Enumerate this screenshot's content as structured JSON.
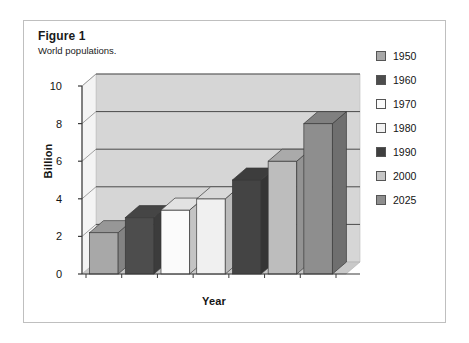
{
  "figure": {
    "title": "Figure 1",
    "subtitle": "World populations."
  },
  "chart_data": {
    "type": "bar",
    "title": "",
    "subtitle": "World populations.",
    "xlabel": "Year",
    "ylabel": "Billion",
    "categories": [
      "1950",
      "1960",
      "1970",
      "1980",
      "1990",
      "2000",
      "2025"
    ],
    "values": [
      2.2,
      3.0,
      3.4,
      4.0,
      5.0,
      6.0,
      8.0
    ],
    "ylim": [
      0,
      10
    ],
    "yticks": [
      "0",
      "2",
      "4",
      "6",
      "8",
      "10"
    ],
    "ytick_values": [
      0,
      2,
      4,
      6,
      8,
      10
    ],
    "grid": "horizontal",
    "legend_position": "right",
    "style": "3d-bar",
    "series": [
      {
        "name": "World population",
        "values": [
          2.2,
          3.0,
          3.4,
          4.0,
          5.0,
          6.0,
          8.0
        ]
      }
    ],
    "bar_colors": [
      "#a8a8a8",
      "#4d4d4d",
      "#fbfbfb",
      "#f0f0f0",
      "#444444",
      "#bdbdbd",
      "#8e8e8e"
    ],
    "plot_background": "#d6d6d6",
    "gridline_color": "#4a4a4a"
  },
  "legend": {
    "items": [
      {
        "label": "1950",
        "color": "#a8a8a8"
      },
      {
        "label": "1960",
        "color": "#4d4d4d"
      },
      {
        "label": "1970",
        "color": "#fbfbfb"
      },
      {
        "label": "1980",
        "color": "#f2f2f2"
      },
      {
        "label": "1990",
        "color": "#3f3f3f"
      },
      {
        "label": "2000",
        "color": "#c6c6c6"
      },
      {
        "label": "2025",
        "color": "#8e8e8e"
      }
    ]
  }
}
